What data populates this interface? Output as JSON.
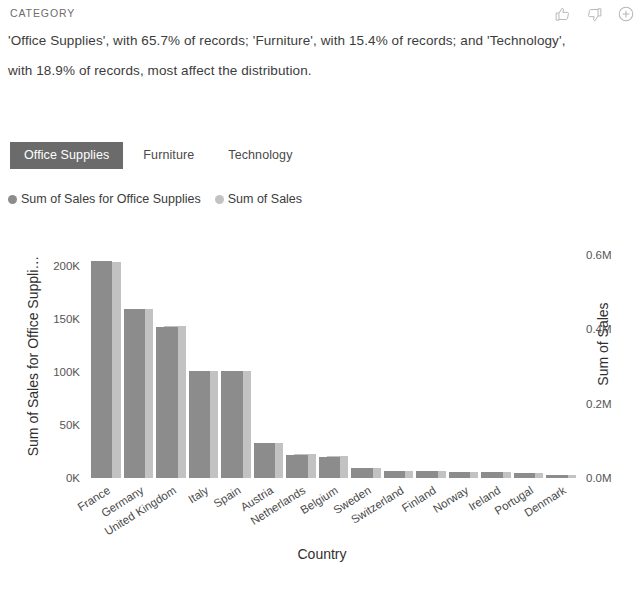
{
  "header": {
    "eyebrow": "CATEGORY",
    "insight": "'Office Supplies', with 65.7% of records; 'Furniture', with 15.4% of records; and 'Technology', with 18.9% of records, most affect the distribution.",
    "actions": [
      {
        "name": "thumbs-up-icon",
        "label": "Thumbs up"
      },
      {
        "name": "thumbs-down-icon",
        "label": "Thumbs down"
      },
      {
        "name": "add-circle-icon",
        "label": "Add"
      }
    ]
  },
  "tabs": [
    {
      "label": "Office Supplies",
      "selected": true
    },
    {
      "label": "Furniture",
      "selected": false
    },
    {
      "label": "Technology",
      "selected": false
    }
  ],
  "legend": [
    {
      "label": "Sum of Sales for Office Supplies",
      "color": "#8c8c8c"
    },
    {
      "label": "Sum of Sales",
      "color": "#c2c2c2"
    }
  ],
  "colors": {
    "series_front": "#8c8c8c",
    "series_back": "#c2c2c2",
    "tab_selected_bg": "#6b6b6b",
    "tab_selected_text": "#ffffff",
    "text": "#3c3c3c",
    "eyebrow": "#6d6d6d",
    "icon": "#b6b6b6"
  },
  "chart_data": {
    "type": "bar",
    "title": "",
    "xlabel": "Country",
    "categories": [
      "France",
      "Germany",
      "United Kingdom",
      "Italy",
      "Spain",
      "Austria",
      "Netherlands",
      "Belgium",
      "Sweden",
      "Switzerland",
      "Finland",
      "Norway",
      "Ireland",
      "Portugal",
      "Denmark"
    ],
    "series": [
      {
        "name": "Sum of Sales for Office Supplies",
        "axis": "left",
        "values": [
          205000,
          160000,
          143000,
          101000,
          101000,
          33000,
          22000,
          20000,
          9000,
          7000,
          6500,
          6000,
          5500,
          5000,
          3000
        ]
      },
      {
        "name": "Sum of Sales",
        "axis": "right",
        "values": [
          582000,
          455000,
          408000,
          288000,
          287000,
          95000,
          64000,
          58000,
          26000,
          20000,
          19000,
          17500,
          16000,
          14500,
          8500
        ]
      }
    ],
    "y_left": {
      "label": "Sum of Sales for Office Suppli…",
      "ticks": [
        "0K",
        "50K",
        "100K",
        "150K",
        "200K"
      ],
      "tick_values": [
        0,
        50000,
        100000,
        150000,
        200000
      ],
      "ylim": [
        0,
        225000
      ]
    },
    "y_right": {
      "label": "Sum of Sales",
      "ticks": [
        "0.0M",
        "0.2M",
        "0.4M",
        "0.6M"
      ],
      "tick_values": [
        0,
        200000,
        400000,
        600000
      ],
      "ylim": [
        0,
        640000
      ]
    },
    "grid": false,
    "legend_position": "top-left"
  }
}
